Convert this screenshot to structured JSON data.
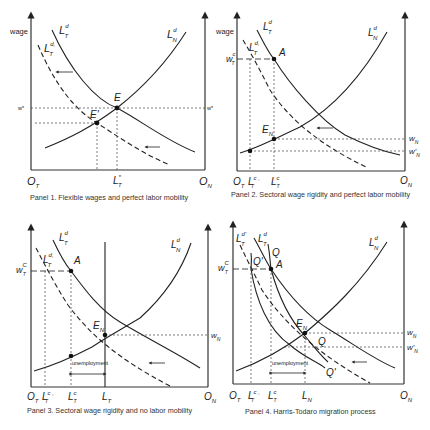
{
  "figure": {
    "axis_label": "wage",
    "panels": [
      {
        "id": 1,
        "caption": "Panel 1.  Flexible wages and perfect labor mobility",
        "labels": {
          "ltd": "L",
          "ltd_sup": "d",
          "ltd_sub": "T",
          "ltd2": "L",
          "ltd2_sup": "d,",
          "ltd2_sub": "T",
          "lnd": "L",
          "lnd_sup": "d",
          "lnd_sub": "N",
          "E": "E",
          "E_prime": "E'",
          "w_left": "w*",
          "w_right": "w*",
          "origin_t": "O",
          "origin_t_sub": "T",
          "origin_n": "O",
          "origin_n_sub": "N",
          "lstar": "L",
          "lstar_sup": "*",
          "lstar_sub": "T"
        }
      },
      {
        "id": 2,
        "caption": "Panel 2.  Sectoral wage rigidity and perfect labor mobility",
        "labels": {
          "ltd": "L",
          "ltd_sup": "d",
          "ltd_sub": "T",
          "ltd2": "L",
          "ltd2_sup": "d,",
          "ltd2_sub": "T",
          "lnd": "L",
          "lnd_sup": "d",
          "lnd_sub": "N",
          "A": "A",
          "EN": "E",
          "EN_sub": "N",
          "wtc": "w",
          "wtc_sup": "c",
          "wtc_sub": "T",
          "wn": "w",
          "wn_sub": "N",
          "wn2": "w'",
          "wn2_sub": "N",
          "origin_t": "O",
          "origin_t_sub": "T",
          "ltc2": "L",
          "ltc2_sup": "c ,",
          "ltc2_sub": "T",
          "ltc": "L",
          "ltc_sup": "c",
          "ltc_sub": "T",
          "origin_n": "O",
          "origin_n_sub": "N"
        }
      },
      {
        "id": 3,
        "caption": "Panel 3.  Sectoral wage rigidity and no labor mobility",
        "labels": {
          "ltd": "L",
          "ltd_sup": "d",
          "ltd_sub": "T",
          "ltd2": "L",
          "ltd2_sup": "d,",
          "ltd2_sub": "T",
          "lnd": "L",
          "lnd_sup": "d",
          "lnd_sub": "N",
          "A": "A",
          "EN": "E",
          "EN_sub": "N",
          "wtc": "w",
          "wtc_sup": "C",
          "wtc_sub": "T",
          "wn": "w",
          "wn_sub": "N",
          "unemployment": "unemployment",
          "origin_t": "O",
          "origin_t_sub": "T",
          "ltc2": "L",
          "ltc2_sup": "c ,",
          "ltc2_sub": "T",
          "ltc": "L",
          "ltc_sup": "c",
          "ltc_sub": "T",
          "lt": "L",
          "lt_sub": "T",
          "origin_n": "O",
          "origin_n_sub": "N"
        }
      },
      {
        "id": 4,
        "caption": "Panel 4.  Harris-Todaro migration process",
        "labels": {
          "ltd2": "L",
          "ltd2_sup": "d'",
          "ltd2_sub": "T",
          "ltd": "L",
          "ltd_sup": "d",
          "ltd_sub": "T",
          "lnd": "L",
          "lnd_sup": "d",
          "lnd_sub": "N",
          "Q_top": "Q",
          "Q_prime_top": "Q'",
          "Q_bottom": "Q",
          "Q_prime_bottom": "Q'",
          "A": "A",
          "EN": "E",
          "EN_sub": "N",
          "wtc": "w",
          "wtc_sup": "C",
          "wtc_sub": "T",
          "wn": "w",
          "wn_sub": "N",
          "wn2": "w'",
          "wn2_sub": "N",
          "unemployment": "unemployment",
          "origin_t": "O",
          "origin_t_sub": "T",
          "ltc2": "L",
          "ltc2_sup": "c ,",
          "ltc2_sub": "T",
          "ltc": "L",
          "ltc_sup": "c",
          "ltc_sub": "T",
          "ln": "L",
          "ln_sub": "N",
          "origin_n": "O",
          "origin_n_sub": "N"
        }
      }
    ]
  }
}
